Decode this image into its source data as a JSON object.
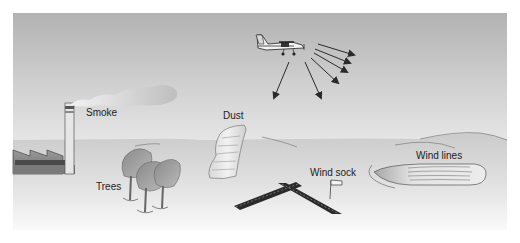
{
  "diagram": {
    "labels": {
      "smoke": "Smoke",
      "dust": "Dust",
      "trees": "Trees",
      "wind_sock": "Wind sock",
      "wind_lines": "Wind lines"
    },
    "elements": [
      {
        "name": "airplane",
        "icon": "airplane-icon"
      },
      {
        "name": "sight-arrows",
        "count": 6
      },
      {
        "name": "factory-smokestack"
      },
      {
        "name": "smoke-cloud"
      },
      {
        "name": "dust-devil"
      },
      {
        "name": "trees",
        "count": 3
      },
      {
        "name": "runway-crossing"
      },
      {
        "name": "wind-sock-flag"
      },
      {
        "name": "lake-wind-lines"
      }
    ],
    "colors": {
      "sky_top": "#b4b4b4",
      "sky_bottom": "#e2e2e2",
      "ground": "#cfcfcf",
      "ground_fade": "#f4f4f4",
      "outline": "#555555",
      "dark": "#2a2a2a"
    }
  }
}
